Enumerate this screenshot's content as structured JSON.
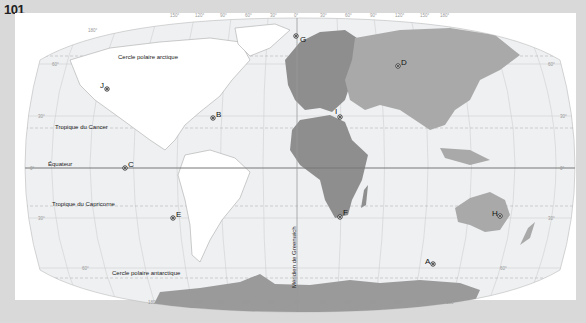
{
  "page_number": "101",
  "map": {
    "title": "Planisphère",
    "lines": {
      "arctic": "Cercle polaire arctique",
      "cancer": "Tropique du Cancer",
      "equator": "Équateur",
      "capricorn": "Tropique du Capricorne",
      "antarctic": "Cercle polaire antarctique",
      "greenwich": "Méridien de Greenwich"
    },
    "longitude_labels": [
      "180°",
      "150°",
      "120°",
      "90°",
      "60°",
      "30°",
      "0°",
      "30°",
      "60°",
      "90°",
      "120°",
      "150°",
      "180°"
    ],
    "latitude_labels": [
      "90°",
      "60°",
      "30°",
      "0°",
      "30°",
      "60°",
      "90°"
    ],
    "points": [
      {
        "id": "A",
        "label": "A"
      },
      {
        "id": "B",
        "label": "B"
      },
      {
        "id": "C",
        "label": "C"
      },
      {
        "id": "D",
        "label": "D"
      },
      {
        "id": "E",
        "label": "E"
      },
      {
        "id": "F",
        "label": "F"
      },
      {
        "id": "G",
        "label": "G"
      },
      {
        "id": "H",
        "label": "H"
      },
      {
        "id": "I",
        "label": "I"
      },
      {
        "id": "J",
        "label": "J"
      }
    ],
    "colors": {
      "ocean": "#eef0f2",
      "africa_europe": "#8e8e8e",
      "asia_oceania": "#a9a9a9",
      "americas": "#ffffff",
      "antarctica": "#9a9a9a",
      "equator_line": "#777777"
    }
  }
}
